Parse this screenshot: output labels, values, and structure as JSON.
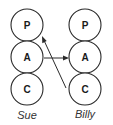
{
  "diagram": {
    "type": "transactional-analysis-ego-states",
    "people": [
      {
        "name": "Sue",
        "states": [
          "P",
          "A",
          "C"
        ]
      },
      {
        "name": "Billy",
        "states": [
          "P",
          "A",
          "C"
        ]
      }
    ],
    "transactions": [
      {
        "from": "Sue.A",
        "to": "Billy.A",
        "label": ""
      },
      {
        "from": "Billy.C",
        "to": "Sue.P",
        "label": ""
      }
    ],
    "colors": {
      "stroke": "#2a2a2a",
      "text": "#1a1a1a",
      "label": "#333333",
      "background": "#ffffff"
    }
  }
}
